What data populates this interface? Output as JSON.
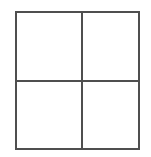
{
  "figure": {
    "title": "",
    "type": "grid-diagram",
    "shape": "square",
    "rows": 2,
    "columns": 2,
    "cell_count": 4,
    "stroke_color": "#4f4f4f",
    "stroke_width_px": 2,
    "fill_color": "#ffffff",
    "background_color": "#ffffff",
    "bounds": {
      "left_px": 15,
      "top_px": 11,
      "width_px": 125,
      "height_px": 139
    },
    "dividers": {
      "vertical_x_px": 81,
      "horizontal_y_px": 80
    },
    "cells": [
      {
        "id": "top-left",
        "label": ""
      },
      {
        "id": "top-right",
        "label": ""
      },
      {
        "id": "bottom-left",
        "label": ""
      },
      {
        "id": "bottom-right",
        "label": ""
      }
    ]
  }
}
